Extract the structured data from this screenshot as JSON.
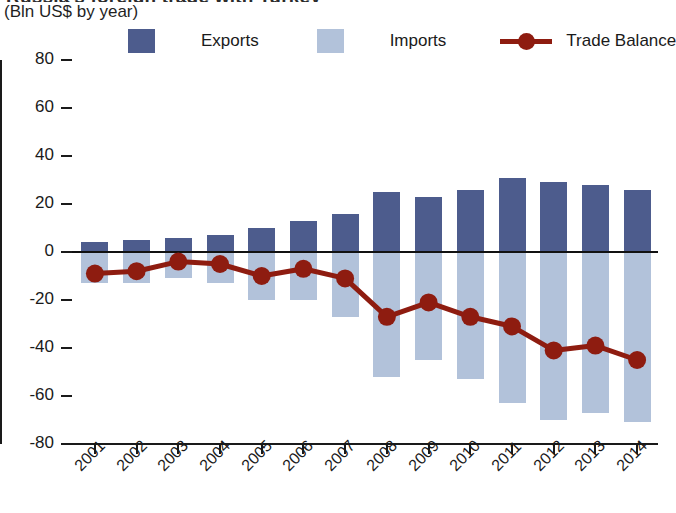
{
  "header": {
    "title_clipped": "Russia's foreign trade with Turkey",
    "subtitle": "(Bln US$ by year)"
  },
  "legend": {
    "items": [
      {
        "label": "Exports",
        "color": "#4d5c8d",
        "marker": "square"
      },
      {
        "label": "Imports",
        "color": "#b2c2da",
        "marker": "square"
      },
      {
        "label": "Trade Balance",
        "color": "#8e1c10",
        "marker": "line-dot"
      }
    ]
  },
  "chart_data": {
    "type": "bar",
    "title": "Russia's foreign trade with Turkey",
    "subtitle": "(Bln US$ by year)",
    "xlabel": "",
    "ylabel": "Bln US$",
    "ylim": [
      -80,
      80
    ],
    "yticks": [
      80,
      60,
      40,
      20,
      0,
      -20,
      -40,
      -60,
      -80
    ],
    "ytick_labels": [
      "80",
      "60",
      "40",
      "20",
      "0",
      "-20",
      "-40",
      "-60",
      "-80"
    ],
    "grid": false,
    "legend_position": "top",
    "categories": [
      "2001",
      "2002",
      "2003",
      "2004",
      "2005",
      "2006",
      "2007",
      "2008",
      "2009",
      "2010",
      "2011",
      "2012",
      "2013",
      "2014"
    ],
    "series": [
      {
        "name": "Exports",
        "type": "bar",
        "color": "#4d5c8d",
        "values": [
          4,
          5,
          6,
          7,
          10,
          13,
          16,
          25,
          23,
          26,
          31,
          29,
          28,
          26
        ]
      },
      {
        "name": "Imports",
        "type": "bar",
        "color": "#b2c2da",
        "values": [
          -13,
          -13,
          -11,
          -13,
          -20,
          -20,
          -27,
          -52,
          -45,
          -53,
          -63,
          -70,
          -67,
          -71
        ]
      },
      {
        "name": "Trade Balance",
        "type": "line",
        "color": "#8e1c10",
        "values": [
          -9,
          -8,
          -4,
          -5,
          -10,
          -7,
          -11,
          -27,
          -21,
          -27,
          -31,
          -41,
          -39,
          -45
        ]
      }
    ]
  }
}
